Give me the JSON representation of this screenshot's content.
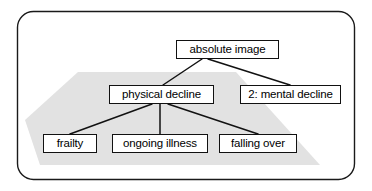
{
  "diagram": {
    "type": "tree-concept-map",
    "frame": {
      "shape": "rounded-rectangle",
      "stroke_color": "#1a1a1a"
    },
    "highlight_region": {
      "label": "shaded-subtree-region",
      "fill_color": "#e2e2e2"
    },
    "nodes": [
      {
        "id": "absolute-image",
        "label": "absolute image",
        "x": 176,
        "y": 40,
        "w": 103,
        "h": 19
      },
      {
        "id": "physical-decline",
        "label": "physical decline",
        "x": 109,
        "y": 85,
        "w": 105,
        "h": 19
      },
      {
        "id": "mental-decline",
        "label": "2: mental decline",
        "x": 240,
        "y": 85,
        "w": 101,
        "h": 19
      },
      {
        "id": "frailty",
        "label": "frailty",
        "x": 43,
        "y": 134,
        "w": 54,
        "h": 19
      },
      {
        "id": "ongoing-illness",
        "label": "ongoing illness",
        "x": 112,
        "y": 134,
        "w": 96,
        "h": 19
      },
      {
        "id": "falling-over",
        "label": "falling over",
        "x": 219,
        "y": 134,
        "w": 78,
        "h": 19
      }
    ],
    "edges": [
      {
        "from": "absolute-image",
        "to": "physical-decline",
        "x1": 202,
        "y1": 59,
        "x2": 163,
        "y2": 85
      },
      {
        "from": "absolute-image",
        "to": "mental-decline",
        "x1": 208,
        "y1": 59,
        "x2": 290,
        "y2": 85
      },
      {
        "from": "physical-decline",
        "to": "frailty",
        "x1": 152,
        "y1": 104,
        "x2": 70,
        "y2": 134
      },
      {
        "from": "physical-decline",
        "to": "ongoing-illness",
        "x1": 160,
        "y1": 104,
        "x2": 160,
        "y2": 134
      },
      {
        "from": "physical-decline",
        "to": "falling-over",
        "x1": 168,
        "y1": 104,
        "x2": 258,
        "y2": 134
      }
    ]
  }
}
